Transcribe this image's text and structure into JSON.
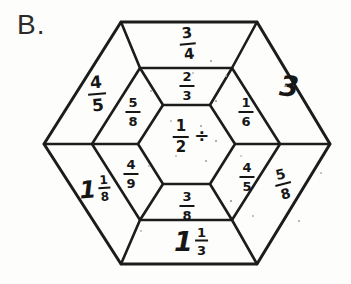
{
  "figure_label": "B.",
  "puzzle": {
    "type": "fraction-division-hexagon",
    "center": {
      "fraction": {
        "numerator": "1",
        "denominator": "2"
      },
      "operator": "÷"
    },
    "middle_ring": {
      "top": {
        "numerator": "2",
        "denominator": "3"
      },
      "upper_right": {
        "numerator": "1",
        "denominator": "6"
      },
      "lower_right": {
        "numerator": "4",
        "denominator": "5"
      },
      "bottom": {
        "numerator": "3",
        "denominator": "8"
      },
      "lower_left": {
        "numerator": "4",
        "denominator": "9"
      },
      "upper_left": {
        "numerator": "5",
        "denominator": "8"
      }
    },
    "outer_ring": {
      "top": {
        "numerator": "3",
        "denominator": "4"
      },
      "upper_right": {
        "whole": "3"
      },
      "lower_right": {
        "numerator": "5",
        "denominator": "8"
      },
      "bottom": {
        "whole": "1",
        "numerator": "1",
        "denominator": "3"
      },
      "lower_left": {
        "whole": "1",
        "numerator": "1",
        "denominator": "8"
      },
      "upper_left": {
        "numerator": "4",
        "denominator": "5"
      }
    },
    "line_color": "#1c1c1c"
  }
}
